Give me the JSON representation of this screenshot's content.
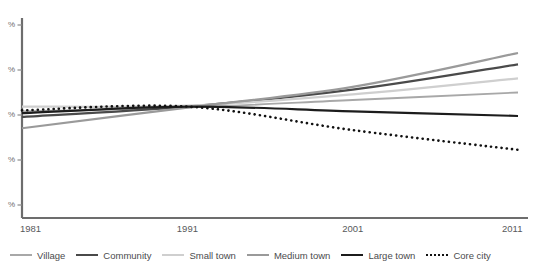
{
  "chart_data": {
    "type": "line",
    "title": "",
    "subtitle": "",
    "xlabel": "",
    "ylabel": "%",
    "grid": false,
    "legend_position": "bottom",
    "x": [
      1981,
      1991,
      2001,
      2011
    ],
    "xlim": [
      1981,
      2011
    ],
    "xticks": [
      "1981",
      "1991",
      "2001",
      "2011"
    ],
    "ylim": [
      0,
      100
    ],
    "yticks": [
      "%",
      "%",
      "%",
      "%",
      "%"
    ],
    "ytick_note": "numeric portions of y-axis labels are cropped off the left edge of the screenshot; only percent signs are visible",
    "series": [
      {
        "name": "Village",
        "color": "#a8a8a8",
        "style": "solid",
        "width": 1.8,
        "values": [
          52.5,
          54.5,
          58.5,
          62.5
        ]
      },
      {
        "name": "Community",
        "color": "#4a4a4a",
        "style": "solid",
        "width": 2.2,
        "values": [
          49.5,
          55.0,
          64.0,
          77.5
        ]
      },
      {
        "name": "Small town",
        "color": "#cfcfcf",
        "style": "solid",
        "width": 2.2,
        "values": [
          55.0,
          55.5,
          61.5,
          70.0
        ]
      },
      {
        "name": "Medium town",
        "color": "#9a9a9a",
        "style": "solid",
        "width": 2.2,
        "values": [
          43.5,
          54.5,
          65.5,
          83.5
        ]
      },
      {
        "name": "Large town",
        "color": "#1c1c1c",
        "style": "solid",
        "width": 2.2,
        "values": [
          51.5,
          55.0,
          52.5,
          50.0
        ]
      },
      {
        "name": "Core city",
        "color": "#111111",
        "style": "dotted",
        "width": 2.6,
        "values": [
          53.0,
          55.0,
          42.5,
          32.0
        ]
      }
    ]
  },
  "axis": {
    "xticks": [
      {
        "label": "1981"
      },
      {
        "label": "1991"
      },
      {
        "label": "2001"
      },
      {
        "label": "2011"
      }
    ],
    "yticks": [
      {
        "label": "%"
      },
      {
        "label": "%"
      },
      {
        "label": "%"
      },
      {
        "label": "%"
      },
      {
        "label": "%"
      }
    ]
  },
  "legend": {
    "items": [
      {
        "label": "Village"
      },
      {
        "label": "Community"
      },
      {
        "label": "Small town"
      },
      {
        "label": "Medium town"
      },
      {
        "label": "Large town"
      },
      {
        "label": "Core city"
      }
    ]
  }
}
